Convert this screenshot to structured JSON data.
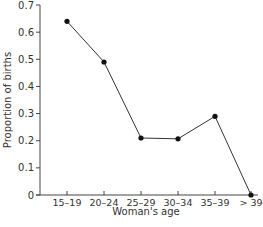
{
  "chart_data": {
    "type": "line",
    "title": "",
    "xlabel": "Woman's age",
    "ylabel": "Proportion of births",
    "categories": [
      "15–19",
      "20–24",
      "25–29",
      "30–34",
      "35–39",
      "> 39"
    ],
    "series": [
      {
        "name": "Proportion of births",
        "values": [
          0.64,
          0.49,
          0.21,
          0.207,
          0.29,
          0.0
        ]
      }
    ],
    "ylim": [
      0,
      0.7
    ],
    "yticks": [
      0,
      0.1,
      0.2,
      0.3,
      0.4,
      0.5,
      0.6,
      0.7
    ],
    "ytick_labels": [
      "0",
      "0.1",
      "0.2",
      "0.3",
      "0.4",
      "0.5",
      "0.6",
      "0.7"
    ],
    "grid": false,
    "legend": null,
    "markers": true,
    "colors": {
      "line": "#333333",
      "marker": "#111111",
      "axis": "#444444"
    }
  }
}
